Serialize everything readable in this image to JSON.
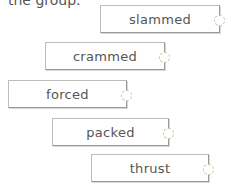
{
  "intro_text": "the group.",
  "words": [
    {
      "label": "slammed",
      "x": 100,
      "y": 5,
      "w": 120
    },
    {
      "label": "crammed",
      "x": 45,
      "y": 42,
      "w": 120
    },
    {
      "label": "forced",
      "x": 8,
      "y": 80,
      "w": 119
    },
    {
      "label": "packed",
      "x": 52,
      "y": 118,
      "w": 117
    },
    {
      "label": "thrust",
      "x": 91,
      "y": 154,
      "w": 118
    }
  ]
}
